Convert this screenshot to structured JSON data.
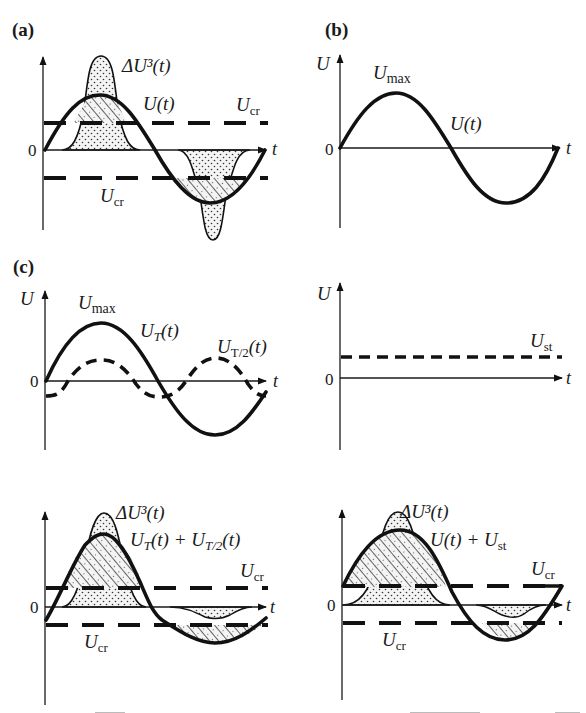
{
  "figure": {
    "panels": [
      {
        "id": "a",
        "label": "(a)",
        "zero": "0",
        "t_axis": "t",
        "curves": {
          "delta": "ΔU³(t)",
          "signal": "U(t)",
          "ucr_upper": "U",
          "ucr_upper_sub": "cr",
          "ucr_lower": "U",
          "ucr_lower_sub": "cr"
        }
      },
      {
        "id": "b",
        "label": "(b)",
        "y_axis": "U",
        "zero": "0",
        "t_axis": "t",
        "curves": {
          "umax": "U",
          "umax_sub": "max",
          "signal": "U(t)"
        }
      },
      {
        "id": "c",
        "label": "(c)",
        "y_axis": "U",
        "zero": "0",
        "t_axis": "t",
        "curves": {
          "umax": "U",
          "umax_sub": "max",
          "ut": "U",
          "ut_sub": "T",
          "ut_arg": "(t)",
          "ut2": "U",
          "ut2_sub": "T/2",
          "ut2_arg": "(t)"
        }
      },
      {
        "id": "c-static",
        "y_axis": "U",
        "zero": "0",
        "t_axis": "t",
        "curves": {
          "ust": "U",
          "ust_sub": "st"
        }
      },
      {
        "id": "c-sum-harmonic",
        "zero": "0",
        "t_axis": "t",
        "curves": {
          "delta": "ΔU³(t)",
          "sum_a": "U",
          "sum_a_sub": "T",
          "sum_a_arg": "(t) + ",
          "sum_b": "U",
          "sum_b_sub": "T/2",
          "sum_b_arg": "(t)",
          "ucr_upper": "U",
          "ucr_upper_sub": "cr",
          "ucr_lower": "U",
          "ucr_lower_sub": "cr"
        }
      },
      {
        "id": "c-sum-static",
        "zero": "0",
        "t_axis": "t",
        "curves": {
          "delta": "ΔU³(t)",
          "sum": "U(t) + U",
          "sum_sub": "st",
          "ucr_upper": "U",
          "ucr_upper_sub": "cr",
          "ucr_lower": "U",
          "ucr_lower_sub": "cr"
        }
      }
    ],
    "caption_visible": "partially cut off (unreadable)"
  }
}
